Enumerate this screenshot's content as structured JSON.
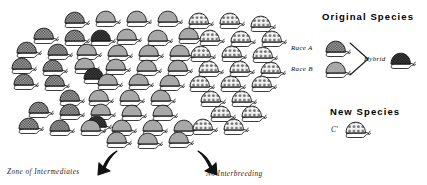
{
  "figure": {
    "title_absent": true,
    "type": "ring-species-cline-diagram"
  },
  "annotations": {
    "zone_of_intermediates": "Zone of Intermediates",
    "no_interbreeding": "No Interbreeding"
  },
  "legend": {
    "original_species_heading": "Original Species",
    "race_a_label": "Race A",
    "race_b_label": "Race B",
    "hybrid_label": "Hybrid",
    "new_species_heading": "New Species",
    "new_species_symbol": "C'"
  },
  "colors": {
    "shell_checkered_light": "#b8b8b8",
    "shell_checkered_dark": "#4a4a4a",
    "shell_plain_gray": "#a8a8a8",
    "shell_spotted_white": "#f2f2f2",
    "spot_color": "#6e6e6e",
    "outline": "#1a1a1a",
    "background": "#ffffff",
    "arrow_black": "#111111"
  },
  "icons": {
    "snail_checkered_light": "snail-checkered-light-icon",
    "snail_checkered_dark": "snail-checkered-dark-icon",
    "snail_plain_gray": "snail-plain-gray-icon",
    "snail_spotted": "snail-spotted-icon",
    "pointer_left": "black-pointer-arrow-icon",
    "pointer_right": "black-pointer-arrow-icon",
    "hybrid_bracket": "hybrid-bracket-icon"
  },
  "chart_data": {
    "type": "scatter",
    "title": "",
    "xlabel": "",
    "ylabel": "",
    "legend_position": "right",
    "grid": false,
    "morph_categories": [
      "checkered-light",
      "checkered-dark",
      "plain-gray",
      "spotted"
    ],
    "morph_counts": [
      17,
      4,
      22,
      16
    ],
    "series": [
      {
        "name": "checkered-light",
        "points": [
          [
            62,
            14
          ],
          [
            31,
            30
          ],
          [
            62,
            32
          ],
          [
            14,
            44
          ],
          [
            45,
            46
          ],
          [
            9,
            60
          ],
          [
            40,
            62
          ],
          [
            11,
            76
          ],
          [
            42,
            77
          ],
          [
            57,
            92
          ],
          [
            26,
            104
          ],
          [
            57,
            106
          ],
          [
            16,
            120
          ],
          [
            47,
            122
          ]
        ]
      },
      {
        "name": "checkered-dark",
        "points": [
          [
            88,
            32
          ],
          [
            81,
            70
          ],
          [
            84,
            118
          ]
        ]
      },
      {
        "name": "plain-gray",
        "points": [
          [
            93,
            13
          ],
          [
            124,
            13
          ],
          [
            155,
            13
          ],
          [
            114,
            31
          ],
          [
            145,
            32
          ],
          [
            176,
            30
          ],
          [
            74,
            46
          ],
          [
            105,
            47
          ],
          [
            136,
            47
          ],
          [
            167,
            47
          ],
          [
            72,
            60
          ],
          [
            103,
            61
          ],
          [
            134,
            62
          ],
          [
            165,
            62
          ],
          [
            95,
            76
          ],
          [
            126,
            76
          ],
          [
            157,
            77
          ],
          [
            86,
            92
          ],
          [
            117,
            92
          ],
          [
            148,
            92
          ],
          [
            88,
            106
          ],
          [
            119,
            107
          ],
          [
            150,
            107
          ],
          [
            78,
            122
          ],
          [
            109,
            122
          ],
          [
            140,
            122
          ],
          [
            171,
            122
          ],
          [
            104,
            134
          ],
          [
            135,
            135
          ],
          [
            166,
            134
          ]
        ]
      },
      {
        "name": "spotted",
        "points": [
          [
            186,
            14
          ],
          [
            217,
            14
          ],
          [
            248,
            17
          ],
          [
            197,
            31
          ],
          [
            228,
            32
          ],
          [
            259,
            32
          ],
          [
            188,
            47
          ],
          [
            219,
            47
          ],
          [
            250,
            48
          ],
          [
            196,
            62
          ],
          [
            227,
            62
          ],
          [
            258,
            63
          ],
          [
            187,
            77
          ],
          [
            218,
            77
          ],
          [
            249,
            77
          ],
          [
            198,
            92
          ],
          [
            229,
            92
          ],
          [
            208,
            107
          ],
          [
            239,
            107
          ],
          [
            190,
            120
          ],
          [
            221,
            120
          ]
        ]
      }
    ]
  },
  "snails": [
    {
      "x": 62,
      "y": 10,
      "m": "c"
    },
    {
      "x": 93,
      "y": 9,
      "m": "g"
    },
    {
      "x": 124,
      "y": 9,
      "m": "g"
    },
    {
      "x": 155,
      "y": 9,
      "m": "g"
    },
    {
      "x": 186,
      "y": 11,
      "m": "s"
    },
    {
      "x": 217,
      "y": 11,
      "m": "s"
    },
    {
      "x": 248,
      "y": 14,
      "m": "s"
    },
    {
      "x": 31,
      "y": 26,
      "m": "c"
    },
    {
      "x": 62,
      "y": 28,
      "m": "c"
    },
    {
      "x": 88,
      "y": 28,
      "m": "d"
    },
    {
      "x": 114,
      "y": 27,
      "m": "g"
    },
    {
      "x": 145,
      "y": 28,
      "m": "g"
    },
    {
      "x": 176,
      "y": 26,
      "m": "g"
    },
    {
      "x": 197,
      "y": 28,
      "m": "s"
    },
    {
      "x": 228,
      "y": 29,
      "m": "s"
    },
    {
      "x": 259,
      "y": 29,
      "m": "s"
    },
    {
      "x": 14,
      "y": 40,
      "m": "c"
    },
    {
      "x": 45,
      "y": 42,
      "m": "c"
    },
    {
      "x": 74,
      "y": 42,
      "m": "g"
    },
    {
      "x": 105,
      "y": 43,
      "m": "g"
    },
    {
      "x": 136,
      "y": 43,
      "m": "g"
    },
    {
      "x": 167,
      "y": 43,
      "m": "g"
    },
    {
      "x": 188,
      "y": 44,
      "m": "s"
    },
    {
      "x": 219,
      "y": 44,
      "m": "s"
    },
    {
      "x": 250,
      "y": 45,
      "m": "s"
    },
    {
      "x": 9,
      "y": 56,
      "m": "c"
    },
    {
      "x": 40,
      "y": 58,
      "m": "c"
    },
    {
      "x": 72,
      "y": 56,
      "m": "g"
    },
    {
      "x": 81,
      "y": 66,
      "m": "d"
    },
    {
      "x": 103,
      "y": 57,
      "m": "g"
    },
    {
      "x": 134,
      "y": 58,
      "m": "g"
    },
    {
      "x": 165,
      "y": 58,
      "m": "g"
    },
    {
      "x": 196,
      "y": 59,
      "m": "s"
    },
    {
      "x": 227,
      "y": 59,
      "m": "s"
    },
    {
      "x": 258,
      "y": 60,
      "m": "s"
    },
    {
      "x": 11,
      "y": 72,
      "m": "c"
    },
    {
      "x": 42,
      "y": 73,
      "m": "c"
    },
    {
      "x": 95,
      "y": 72,
      "m": "g"
    },
    {
      "x": 126,
      "y": 72,
      "m": "g"
    },
    {
      "x": 157,
      "y": 73,
      "m": "g"
    },
    {
      "x": 187,
      "y": 74,
      "m": "s"
    },
    {
      "x": 218,
      "y": 74,
      "m": "s"
    },
    {
      "x": 249,
      "y": 74,
      "m": "s"
    },
    {
      "x": 57,
      "y": 88,
      "m": "c"
    },
    {
      "x": 86,
      "y": 88,
      "m": "g"
    },
    {
      "x": 117,
      "y": 88,
      "m": "g"
    },
    {
      "x": 148,
      "y": 88,
      "m": "g"
    },
    {
      "x": 198,
      "y": 89,
      "m": "s"
    },
    {
      "x": 229,
      "y": 89,
      "m": "s"
    },
    {
      "x": 26,
      "y": 100,
      "m": "c"
    },
    {
      "x": 57,
      "y": 102,
      "m": "c"
    },
    {
      "x": 88,
      "y": 102,
      "m": "g"
    },
    {
      "x": 119,
      "y": 103,
      "m": "g"
    },
    {
      "x": 150,
      "y": 103,
      "m": "g"
    },
    {
      "x": 208,
      "y": 104,
      "m": "s"
    },
    {
      "x": 239,
      "y": 104,
      "m": "s"
    },
    {
      "x": 16,
      "y": 116,
      "m": "c"
    },
    {
      "x": 47,
      "y": 118,
      "m": "c"
    },
    {
      "x": 84,
      "y": 114,
      "m": "d"
    },
    {
      "x": 78,
      "y": 118,
      "m": "g"
    },
    {
      "x": 109,
      "y": 118,
      "m": "g"
    },
    {
      "x": 140,
      "y": 118,
      "m": "g"
    },
    {
      "x": 171,
      "y": 118,
      "m": "g"
    },
    {
      "x": 190,
      "y": 117,
      "m": "s"
    },
    {
      "x": 221,
      "y": 117,
      "m": "s"
    },
    {
      "x": 104,
      "y": 130,
      "m": "g"
    },
    {
      "x": 135,
      "y": 131,
      "m": "g"
    },
    {
      "x": 166,
      "y": 130,
      "m": "g"
    }
  ]
}
